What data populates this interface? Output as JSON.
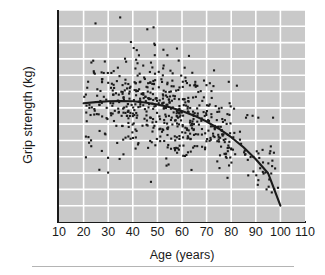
{
  "chart_data": {
    "type": "scatter",
    "title": "",
    "xlabel": "Age (years)",
    "ylabel": "Grip strength (kg)",
    "xlim": [
      10,
      110
    ],
    "ylim": [
      30,
      160
    ],
    "xticks": [
      10,
      20,
      30,
      40,
      50,
      60,
      70,
      80,
      90,
      100,
      110
    ],
    "yticks": [
      30,
      40,
      50,
      60,
      70,
      80,
      90,
      100,
      110,
      120,
      130,
      140,
      150,
      160
    ],
    "grid": true,
    "legend": "none",
    "plot_background": "#c9c9c9",
    "gridline_color": "#ffffff",
    "point_color": "#1a1a1a",
    "curve_color": "#1a1a1a",
    "point_count": 600,
    "series": [
      {
        "name": "Fitted curve",
        "type": "line",
        "x": [
          20,
          25,
          30,
          35,
          40,
          45,
          50,
          55,
          60,
          65,
          70,
          75,
          80,
          85,
          90,
          95,
          100
        ],
        "values": [
          102.8,
          103.5,
          104.0,
          104.2,
          104.0,
          103.3,
          102.1,
          100.4,
          98.1,
          95.2,
          91.6,
          87.2,
          82.0,
          75.8,
          68.5,
          59.9,
          40.0
        ]
      },
      {
        "name": "Observations",
        "type": "scatter",
        "x_range": [
          19,
          101
        ],
        "y_range": [
          40,
          158
        ],
        "description": "Individual grip strength measurements by age; spread narrows and mean declines after age 45."
      }
    ]
  }
}
